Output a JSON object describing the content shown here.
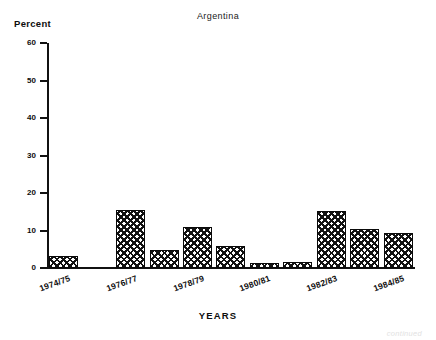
{
  "chart_data": {
    "type": "bar",
    "title": "Argentina",
    "xlabel": "YEARS",
    "ylabel": "Percent",
    "ylim": [
      0,
      60
    ],
    "yticks": [
      0,
      10,
      20,
      30,
      40,
      50,
      60
    ],
    "grid": false,
    "legend": null,
    "categories": [
      "1974/75",
      "1975/76",
      "1976/77",
      "1977/78",
      "1978/79",
      "1979/80",
      "1980/81",
      "1981/82",
      "1982/83",
      "1983/84",
      "1984/85"
    ],
    "tick_labels": [
      "1974/75",
      "1976/77",
      "1978/79",
      "1980/81",
      "1982/83",
      "1984/85"
    ],
    "values": [
      3.3,
      0,
      15.6,
      4.7,
      11.0,
      5.8,
      1.3,
      1.5,
      15.3,
      10.3,
      9.3
    ]
  },
  "footer": {
    "note": "continued"
  }
}
